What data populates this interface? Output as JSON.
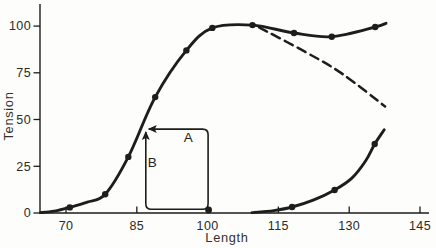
{
  "canvas": {
    "width": 436,
    "height": 248,
    "background": "#fdfdfb",
    "ink": "#1d1d1b"
  },
  "chart_data": {
    "type": "line",
    "title": "",
    "xlabel": "Length",
    "ylabel": "Tension",
    "x_ticks": [
      70,
      85,
      100,
      115,
      130,
      145
    ],
    "y_ticks": [
      0,
      25,
      50,
      75,
      100
    ],
    "xlim": [
      64.49,
      146.9
    ],
    "ylim": [
      0,
      108.6
    ],
    "grid": false,
    "legend": "none",
    "series": [
      {
        "name": "total-tension",
        "line": "solid",
        "width": 2.9,
        "points": [
          [
            64.6,
            0.2
          ],
          [
            67.5,
            1.0
          ],
          [
            70.8,
            3.0
          ],
          [
            74.5,
            5.8
          ],
          [
            78.3,
            10.0
          ],
          [
            83.2,
            30.0
          ],
          [
            88.9,
            62.0
          ],
          [
            95.5,
            87.0
          ],
          [
            101.0,
            99.0
          ],
          [
            109.5,
            100.5
          ],
          [
            118.3,
            96.3
          ],
          [
            126.3,
            94.3
          ],
          [
            135.5,
            99.5
          ],
          [
            137.8,
            101.5
          ]
        ],
        "markers": [
          [
            70.8,
            3.0
          ],
          [
            78.3,
            10.0
          ],
          [
            83.2,
            30.0
          ],
          [
            88.9,
            62.0
          ],
          [
            95.5,
            87.0
          ],
          [
            101.0,
            99.0
          ],
          [
            109.5,
            100.5
          ],
          [
            118.3,
            96.3
          ],
          [
            126.3,
            94.3
          ],
          [
            135.5,
            99.5
          ]
        ]
      },
      {
        "name": "extrapolated-tension-dashed",
        "line": "dashed",
        "width": 2.5,
        "points": [
          [
            110.9,
            99.3
          ],
          [
            120.6,
            86.3
          ],
          [
            128.4,
            74.7
          ],
          [
            137.6,
            57.0
          ]
        ],
        "markers": []
      },
      {
        "name": "passive-tension",
        "line": "solid",
        "width": 2.9,
        "points": [
          [
            109.4,
            0.2
          ],
          [
            114.0,
            1.3
          ],
          [
            117.9,
            3.2
          ],
          [
            122.5,
            7.0
          ],
          [
            126.9,
            12.3
          ],
          [
            130.5,
            18.5
          ],
          [
            133.5,
            28.0
          ],
          [
            135.4,
            36.9
          ],
          [
            137.4,
            44.5
          ]
        ],
        "markers": [
          [
            117.9,
            3.2
          ],
          [
            126.9,
            12.3
          ],
          [
            135.4,
            36.9
          ]
        ]
      }
    ],
    "annotations": {
      "release_loop": {
        "rect": {
          "left_length": 86.9,
          "right_length": 100.1,
          "top_tension": 44.9,
          "bottom_tension": 2.0
        },
        "corner_dot": {
          "length": 100.2,
          "tension": 1.6
        },
        "arrow_left_label": {
          "text": "A",
          "length": 95.9,
          "tension": 40.3
        },
        "arrow_up_label": {
          "text": "B",
          "length": 88.3,
          "tension": 27.2
        }
      }
    }
  }
}
